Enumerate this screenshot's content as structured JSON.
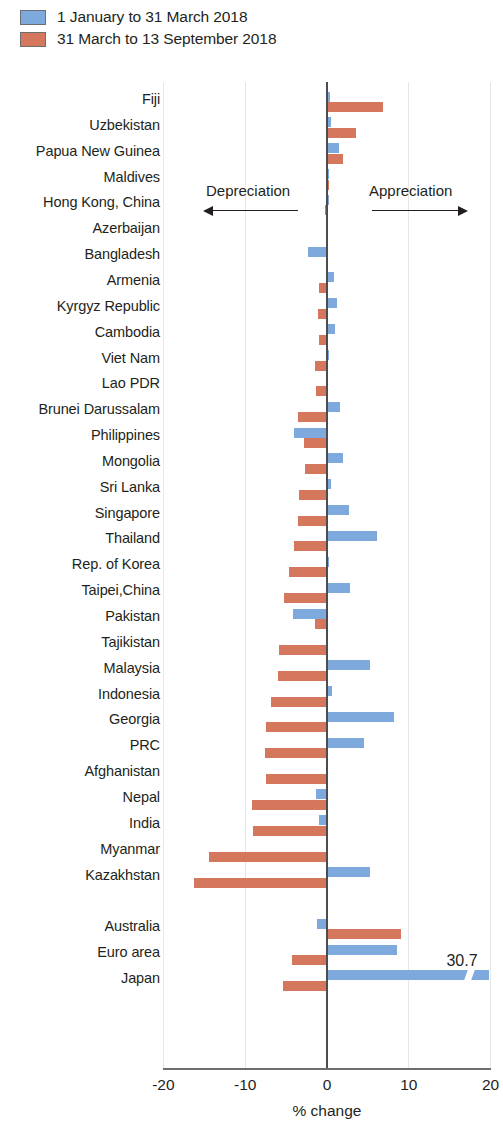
{
  "legend": {
    "items": [
      {
        "label": "1 January to 31 March 2018",
        "color": "#7ea9dd",
        "name": "series-q1"
      },
      {
        "label": "31 March to 13 September 2018",
        "color": "#d4775d",
        "name": "series-q2q3"
      }
    ]
  },
  "annotations": {
    "depreciation": "Depreciation",
    "appreciation": "Appreciation",
    "japan_value_label": "30.7"
  },
  "axis": {
    "x_title": "% change",
    "ticks": [
      "-20",
      "-10",
      "0",
      "10",
      "20"
    ],
    "tick_values": [
      -20,
      -10,
      0,
      10,
      20
    ],
    "xlim": [
      -20,
      20
    ]
  },
  "chart_data": {
    "type": "bar",
    "orientation": "horizontal",
    "title": "",
    "subtitle": "",
    "xlabel": "% change",
    "ylabel": "",
    "xlim": [
      -20,
      20
    ],
    "grid": "vertical-light",
    "legend_position": "top-left",
    "note": "Japan blue bar is truncated with an axis break; its true value is 30.7",
    "categories": [
      "Fiji",
      "Uzbekistan",
      "Papua New Guinea",
      "Maldives",
      "Hong Kong, China",
      "Azerbaijan",
      "Bangladesh",
      "Armenia",
      "Kyrgyz Republic",
      "Cambodia",
      "Viet Nam",
      "Lao PDR",
      "Brunei Darussalam",
      "Philippines",
      "Mongolia",
      "Sri Lanka",
      "Singapore",
      "Thailand",
      "Rep. of Korea",
      "Taipei,China",
      "Pakistan",
      "Tajikistan",
      "Malaysia",
      "Indonesia",
      "Georgia",
      "PRC",
      "Afghanistan",
      "Nepal",
      "India",
      "Myanmar",
      "Kazakhstan",
      "",
      "Australia",
      "Euro area",
      "Japan"
    ],
    "series": [
      {
        "name": "1 January to 31 March 2018",
        "color": "#7ea9dd",
        "values": [
          0.4,
          0.5,
          1.5,
          0.2,
          0.2,
          0.1,
          -2.3,
          0.9,
          1.2,
          1.0,
          0.3,
          0.1,
          1.6,
          -4.0,
          1.9,
          0.5,
          2.7,
          6.1,
          0.3,
          2.8,
          -4.2,
          0.1,
          5.2,
          0.6,
          8.2,
          4.5,
          0.0,
          -1.3,
          -1.0,
          -0.1,
          5.3,
          null,
          -1.2,
          8.6,
          30.7
        ]
      },
      {
        "name": "31 March to 13 September 2018",
        "color": "#d4775d",
        "values": [
          6.9,
          3.6,
          2.0,
          0.2,
          -0.2,
          -0.1,
          0.0,
          -1.0,
          -1.1,
          -1.0,
          -1.5,
          -1.4,
          -3.6,
          -2.8,
          -2.7,
          -3.4,
          -3.6,
          -4.0,
          -4.6,
          -5.3,
          -1.5,
          -5.9,
          -6.0,
          -6.8,
          -7.4,
          -7.6,
          -7.4,
          -9.2,
          -9.0,
          -14.4,
          -16.2,
          null,
          9.0,
          -4.3,
          -5.4
        ]
      }
    ]
  },
  "rows": [
    {
      "label": "Fiji",
      "blue": 0.4,
      "red": 6.9
    },
    {
      "label": "Uzbekistan",
      "blue": 0.5,
      "red": 3.6
    },
    {
      "label": "Papua New Guinea",
      "blue": 1.5,
      "red": 2.0
    },
    {
      "label": "Maldives",
      "blue": 0.2,
      "red": 0.2
    },
    {
      "label": "Hong Kong, China",
      "blue": 0.2,
      "red": -0.2
    },
    {
      "label": "Azerbaijan",
      "blue": 0.1,
      "red": -0.1
    },
    {
      "label": "Bangladesh",
      "blue": -2.3,
      "red": 0.0
    },
    {
      "label": "Armenia",
      "blue": 0.9,
      "red": -1.0
    },
    {
      "label": "Kyrgyz Republic",
      "blue": 1.2,
      "red": -1.1
    },
    {
      "label": "Cambodia",
      "blue": 1.0,
      "red": -1.0
    },
    {
      "label": "Viet Nam",
      "blue": 0.3,
      "red": -1.5
    },
    {
      "label": "Lao PDR",
      "blue": 0.1,
      "red": -1.4
    },
    {
      "label": "Brunei Darussalam",
      "blue": 1.6,
      "red": -3.6
    },
    {
      "label": "Philippines",
      "blue": -4.0,
      "red": -2.8
    },
    {
      "label": "Mongolia",
      "blue": 1.9,
      "red": -2.7
    },
    {
      "label": "Sri Lanka",
      "blue": 0.5,
      "red": -3.4
    },
    {
      "label": "Singapore",
      "blue": 2.7,
      "red": -3.6
    },
    {
      "label": "Thailand",
      "blue": 6.1,
      "red": -4.0
    },
    {
      "label": "Rep. of Korea",
      "blue": 0.3,
      "red": -4.6
    },
    {
      "label": "Taipei,China",
      "blue": 2.8,
      "red": -5.3
    },
    {
      "label": "Pakistan",
      "blue": -4.2,
      "red": -1.5
    },
    {
      "label": "Tajikistan",
      "blue": 0.1,
      "red": -5.9
    },
    {
      "label": "Malaysia",
      "blue": 5.2,
      "red": -6.0
    },
    {
      "label": "Indonesia",
      "blue": 0.6,
      "red": -6.8
    },
    {
      "label": "Georgia",
      "blue": 8.2,
      "red": -7.4
    },
    {
      "label": "PRC",
      "blue": 4.5,
      "red": -7.6
    },
    {
      "label": "Afghanistan",
      "blue": 0.0,
      "red": -7.4
    },
    {
      "label": "Nepal",
      "blue": -1.3,
      "red": -9.2
    },
    {
      "label": "India",
      "blue": -1.0,
      "red": -9.0
    },
    {
      "label": "Myanmar",
      "blue": -0.1,
      "red": -14.4
    },
    {
      "label": "Kazakhstan",
      "blue": 5.3,
      "red": -16.2
    },
    {
      "label": "",
      "blue": null,
      "red": null
    },
    {
      "label": "Australia",
      "blue": -1.2,
      "red": 9.0
    },
    {
      "label": "Euro area",
      "blue": 8.6,
      "red": -4.3
    },
    {
      "label": "Japan",
      "blue": 30.7,
      "red": -5.4
    }
  ]
}
